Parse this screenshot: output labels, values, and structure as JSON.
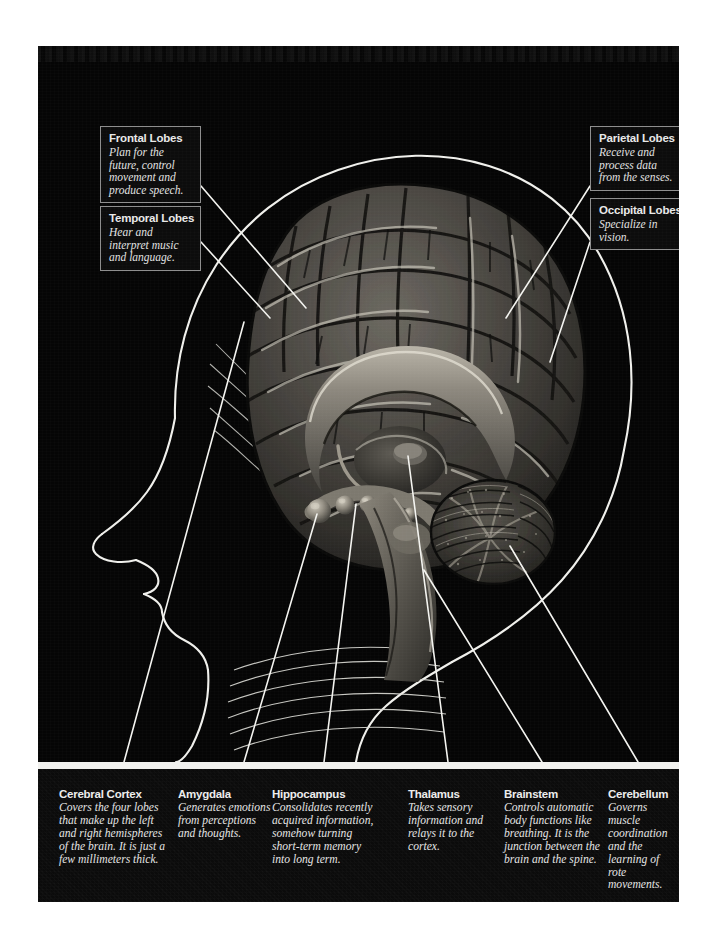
{
  "figure": {
    "panel_bg": "#050505",
    "rule_color": "#f2f2ef",
    "label_border": "#8e8e8e",
    "text_color": "#e6e6e6"
  },
  "callouts": [
    {
      "id": "frontal",
      "heading": "Frontal Lobes",
      "body": "Plan for the future, control movement and produce speech."
    },
    {
      "id": "temporal",
      "heading": "Temporal Lobes",
      "body": "Hear and interpret music and language."
    },
    {
      "id": "parietal",
      "heading": "Parietal Lobes",
      "body": "Receive and process data from the senses."
    },
    {
      "id": "occipital",
      "heading": "Occipital Lobes",
      "body": "Specialize in vision."
    }
  ],
  "captions": [
    {
      "id": "cerebral-cortex",
      "heading": "Cerebral Cortex",
      "body": "Covers the four lobes that make up the left and right hemispheres of the brain. It is just a few millimeters thick."
    },
    {
      "id": "amygdala",
      "heading": "Amygdala",
      "body": "Generates emotions from perceptions and thoughts."
    },
    {
      "id": "hippocampus",
      "heading": "Hippocampus",
      "body": "Consolidates recently acquired information, somehow turning short-term memory into long term."
    },
    {
      "id": "thalamus",
      "heading": "Thalamus",
      "body": "Takes sensory information and relays it to the cortex."
    },
    {
      "id": "brainstem",
      "heading": "Brainstem",
      "body": "Controls automatic body functions like breathing. It is the junction between the brain and the spine."
    },
    {
      "id": "cerebellum",
      "heading": "Cerebellum",
      "body": "Governs muscle coordination and the learning of rote movements."
    }
  ]
}
